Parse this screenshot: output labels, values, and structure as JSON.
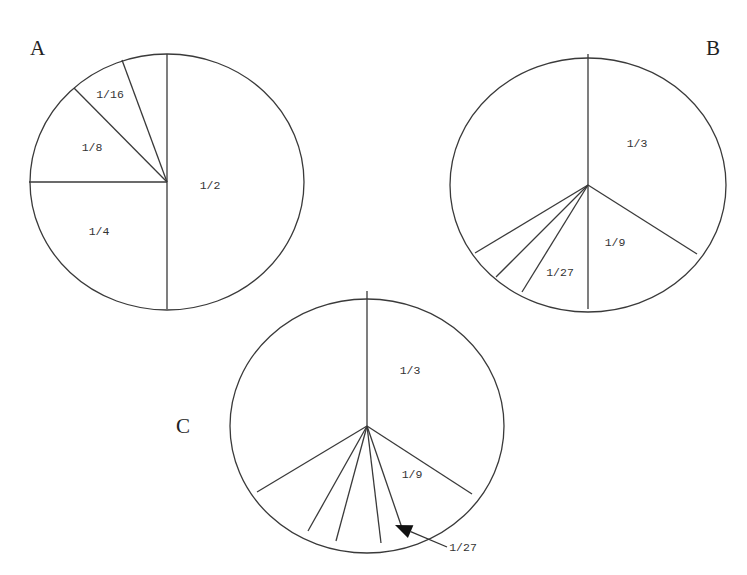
{
  "figure": {
    "panels": [
      {
        "id": "A",
        "label": "A",
        "label_pos": [
          30,
          55
        ],
        "center": [
          167,
          182
        ],
        "radius": [
          137,
          128
        ],
        "spokes": [
          [
            167,
            54
          ],
          [
            122,
            60
          ],
          [
            74,
            88
          ],
          [
            29,
            182
          ],
          [
            167,
            309
          ]
        ],
        "fractions": [
          {
            "text": "1/2",
            "pos": [
              210,
              189
            ]
          },
          {
            "text": "1/4",
            "pos": [
              99,
              235
            ]
          },
          {
            "text": "1/8",
            "pos": [
              92,
              151
            ]
          },
          {
            "text": "1/16",
            "pos": [
              110,
              98
            ]
          }
        ]
      },
      {
        "id": "B",
        "label": "B",
        "label_pos": [
          706,
          55
        ],
        "center": [
          588,
          185
        ],
        "radius": [
          138,
          127
        ],
        "spokes": [
          [
            588,
            54
          ],
          [
            697,
            254
          ],
          [
            588,
            309
          ],
          [
            522,
            292
          ],
          [
            496,
            277
          ],
          [
            475,
            253
          ]
        ],
        "fractions": [
          {
            "text": "1/3",
            "pos": [
              637,
              147
            ]
          },
          {
            "text": "1/9",
            "pos": [
              615,
              246
            ]
          },
          {
            "text": "1/27",
            "pos": [
              560,
              276
            ]
          }
        ]
      },
      {
        "id": "C",
        "label": "C",
        "label_pos": [
          176,
          433
        ],
        "center": [
          367,
          426
        ],
        "radius": [
          137,
          127
        ],
        "spokes": [
          [
            367,
            291
          ],
          [
            472,
            494
          ],
          [
            402,
            528
          ],
          [
            381,
            543
          ],
          [
            336,
            541
          ],
          [
            308,
            531
          ],
          [
            257,
            492
          ]
        ],
        "fractions": [
          {
            "text": "1/3",
            "pos": [
              410,
              374
            ]
          },
          {
            "text": "1/9",
            "pos": [
              412,
              478
            ]
          }
        ],
        "callout": {
          "text": "1/27",
          "text_pos": [
            463,
            551
          ],
          "line_from": [
            447,
            547
          ],
          "line_to": [
            395,
            525
          ]
        }
      }
    ]
  },
  "chart_data": {
    "type": "pie",
    "title": "",
    "panels": [
      {
        "label": "A",
        "slices": [
          "1/2",
          "1/4",
          "1/8",
          "1/16",
          "1/16 (unlabeled)"
        ],
        "values": [
          0.5,
          0.25,
          0.125,
          0.0625,
          0.0625
        ]
      },
      {
        "label": "B",
        "slices": [
          "1/3",
          "1/9",
          "1/27",
          "unlabeled",
          "unlabeled",
          "unlabeled"
        ],
        "values": [
          0.3333,
          0.1111,
          0.037,
          0.0,
          0.0,
          0.0
        ],
        "note": "remaining left region unlabeled; small wedges continue the geometric series"
      },
      {
        "label": "C",
        "slices": [
          "1/3",
          "1/9",
          "1/27",
          "unlabeled",
          "unlabeled",
          "unlabeled"
        ],
        "values": [
          0.3333,
          0.1111,
          0.037,
          0.0,
          0.0,
          0.0
        ],
        "annotation": "arrow pointing to 1/27 wedge"
      }
    ]
  }
}
